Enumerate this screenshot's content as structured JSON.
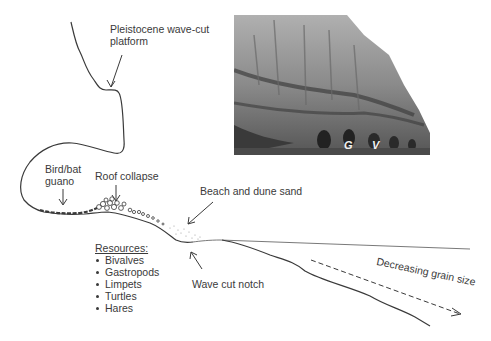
{
  "diagram": {
    "labels": {
      "platform": "Pleistocene wave-cut platform",
      "guano": "Bird/bat guano",
      "roof_collapse": "Roof collapse",
      "beach_sand": "Beach and dune sand",
      "wave_notch": "Wave cut notch",
      "grain_size": "Decreasing grain size"
    },
    "resources": {
      "title": "Resources:",
      "items": [
        "Bivalves",
        "Gastropods",
        "Limpets",
        "Turtles",
        "Hares"
      ]
    },
    "photo": {
      "description": "Coastal limestone cliff with cave entrances at sea level",
      "markers": [
        "G",
        "V"
      ]
    },
    "colors": {
      "line": "#3a3a3a",
      "text": "#3a3a3a",
      "background": "#ffffff"
    }
  }
}
